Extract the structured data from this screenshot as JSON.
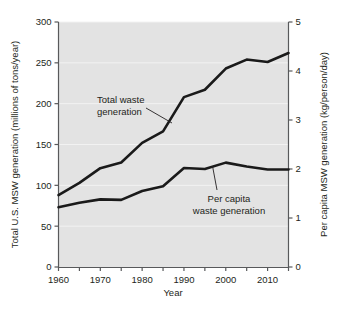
{
  "chart_data": {
    "type": "line",
    "title": "",
    "xlabel": "Year",
    "ylabel": "Total U.S. MSW generation (millions of tons/year)",
    "y2label": "Per capita MSW generation (kg/person/day)",
    "x": [
      1960,
      1965,
      1970,
      1975,
      1980,
      1985,
      1990,
      1995,
      2000,
      2005,
      2010,
      2015
    ],
    "xlim": [
      1960,
      2015
    ],
    "ylim": [
      0,
      300
    ],
    "y2lim": [
      0,
      5
    ],
    "xticks": [
      1960,
      1965,
      1970,
      1975,
      1980,
      1985,
      1990,
      1995,
      2000,
      2005,
      2010,
      2015
    ],
    "xticklabels": [
      "1960",
      "",
      "1970",
      "",
      "1980",
      "",
      "1990",
      "",
      "2000",
      "",
      "2010",
      ""
    ],
    "yticks": [
      0,
      50,
      100,
      150,
      200,
      250,
      300
    ],
    "yticklabels": [
      "0",
      "50",
      "100",
      "150",
      "200",
      "250",
      "300"
    ],
    "y2ticks": [
      0,
      1,
      2,
      3,
      4,
      5
    ],
    "y2ticklabels": [
      "0",
      "1",
      "2",
      "3",
      "4",
      "5"
    ],
    "grid": true,
    "grid_axis": "y",
    "legend": "none",
    "plot_bgcolor": "#e3e3e3",
    "line_color": "#1a1a1a",
    "series": [
      {
        "name": "Total waste generation",
        "axis": "left",
        "values": [
          88,
          103,
          121,
          128,
          152,
          166,
          208,
          217,
          243,
          254,
          251,
          262
        ]
      },
      {
        "name": "Per capita waste generation",
        "axis": "right",
        "values": [
          1.22,
          1.31,
          1.38,
          1.37,
          1.55,
          1.65,
          2.02,
          2.0,
          2.13,
          2.05,
          1.99,
          1.99
        ]
      }
    ],
    "annotations": [
      {
        "id": "total-waste-annotation",
        "line1": "Total waste",
        "line2": "generation"
      },
      {
        "id": "per-capita-annotation",
        "line1": "Per capita",
        "line2": "waste generation"
      }
    ]
  }
}
